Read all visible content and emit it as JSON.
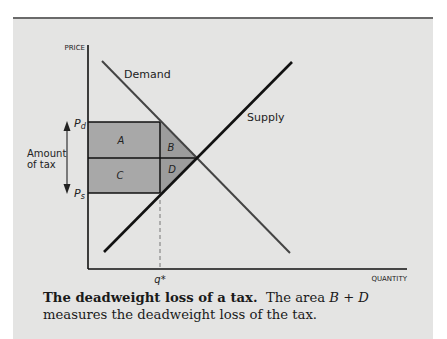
{
  "figure": {
    "y_axis_label": "PRICE",
    "x_axis_label": "QUANTITY",
    "curves": {
      "demand_label": "Demand",
      "supply_label": "Supply"
    },
    "price_labels": {
      "pd": "P",
      "pd_sub": "d",
      "ps": "P",
      "ps_sub": "s"
    },
    "quantity_label": "q*",
    "tax_label_line1": "Amount",
    "tax_label_line2": "of tax",
    "regions": {
      "a": "A",
      "b": "B",
      "c": "C",
      "d": "D"
    },
    "colors": {
      "panel_bg": "#e4e4e3",
      "region_fill": "#a8a8a8",
      "line": "#111111",
      "demand_line": "#444444"
    }
  },
  "caption": {
    "title": "The deadweight loss of a tax",
    "title_end": ".",
    "text_before_math": "The area ",
    "math": "B + D",
    "text_after_math": " measures the deadweight loss of the tax."
  }
}
